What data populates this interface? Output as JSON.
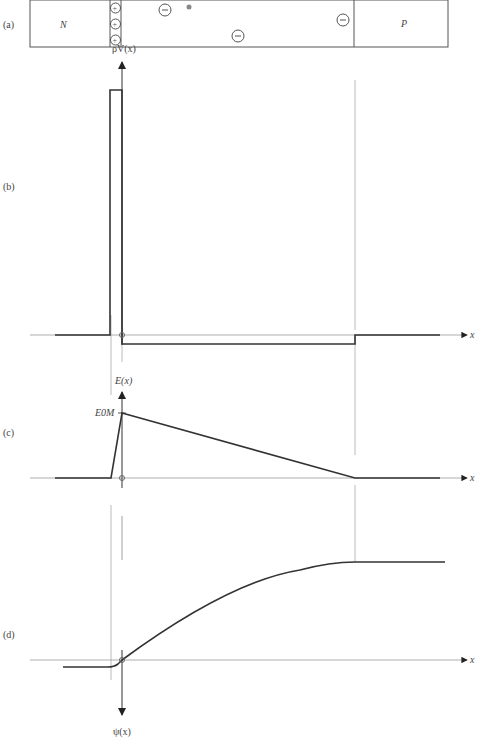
{
  "panels": {
    "a": {
      "label": "(a)",
      "n_region": "N",
      "p_region": "P",
      "plus_sign": "+",
      "minus_sign": "−"
    },
    "b": {
      "label": "(b)",
      "y_axis": "ρV(x)",
      "x_axis": "x"
    },
    "c": {
      "label": "(c)",
      "y_axis": "E(x)",
      "peak_label": "E0M",
      "x_axis": "x"
    },
    "d": {
      "label": "(d)",
      "y_axis": "ψ(x)",
      "x_axis": "x"
    }
  },
  "colors": {
    "line": "#333333",
    "guide": "#aaaaaa",
    "dot": "#888888"
  }
}
